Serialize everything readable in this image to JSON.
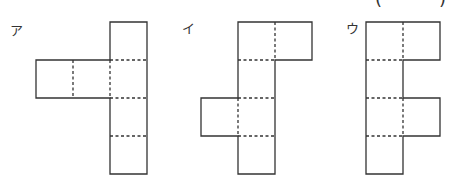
{
  "answer_blank": {
    "open": "(",
    "close": ")"
  },
  "figures": [
    {
      "label": "ア",
      "description": "net: vertical column of 4 squares with 2 squares extending left from second square"
    },
    {
      "label": "イ",
      "description": "net: vertical column of 4 squares with one square right of top and one square left of third"
    },
    {
      "label": "ウ",
      "description": "net: vertical column of 4 squares with squares right of first and third"
    }
  ],
  "colors": {
    "line": "#333333",
    "background": "#ffffff"
  }
}
